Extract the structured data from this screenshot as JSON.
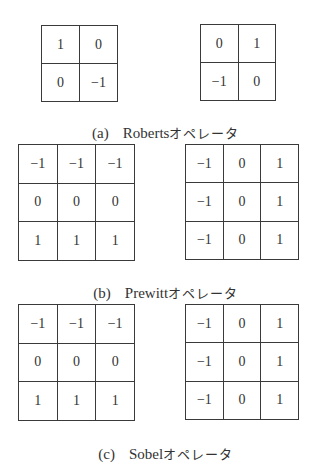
{
  "figure": {
    "panels": [
      {
        "id": "a",
        "label": "(a)",
        "name": "Roberts",
        "suffix": "オペレータ",
        "kernels": [
          [
            [
              "1",
              "0"
            ],
            [
              "0",
              "−1"
            ]
          ],
          [
            [
              "0",
              "1"
            ],
            [
              "−1",
              "0"
            ]
          ]
        ]
      },
      {
        "id": "b",
        "label": "(b)",
        "name": "Prewitt",
        "suffix": "オペレータ",
        "kernels": [
          [
            [
              "−1",
              "−1",
              "−1"
            ],
            [
              "0",
              "0",
              "0"
            ],
            [
              "1",
              "1",
              "1"
            ]
          ],
          [
            [
              "−1",
              "0",
              "1"
            ],
            [
              "−1",
              "0",
              "1"
            ],
            [
              "−1",
              "0",
              "1"
            ]
          ]
        ]
      },
      {
        "id": "c",
        "label": "(c)",
        "name": "Sobel",
        "suffix": "オペレータ",
        "kernels": [
          [
            [
              "−1",
              "−1",
              "−1"
            ],
            [
              "0",
              "0",
              "0"
            ],
            [
              "1",
              "1",
              "1"
            ]
          ],
          [
            [
              "−1",
              "0",
              "1"
            ],
            [
              "−1",
              "0",
              "1"
            ],
            [
              "−1",
              "0",
              "1"
            ]
          ]
        ]
      }
    ]
  }
}
